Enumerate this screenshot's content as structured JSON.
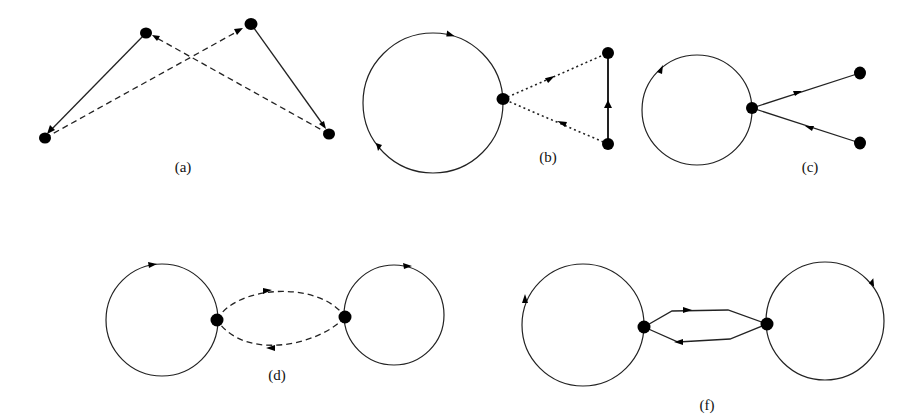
{
  "figure": {
    "background": "#ffffff",
    "ink_color": "#000000",
    "panels": [
      {
        "id": "a",
        "label": "(a)",
        "nodes": [
          {
            "id": "a1",
            "x": 146,
            "y": 33
          },
          {
            "id": "a2",
            "x": 251,
            "y": 24
          },
          {
            "id": "a3",
            "x": 45,
            "y": 138
          },
          {
            "id": "a4",
            "x": 329,
            "y": 134
          }
        ],
        "edges": [
          {
            "from": "a1",
            "to": "a3",
            "style": "solid"
          },
          {
            "from": "a3",
            "to": "a2",
            "style": "dashed"
          },
          {
            "from": "a2",
            "to": "a4",
            "style": "solid"
          },
          {
            "from": "a4",
            "to": "a1",
            "style": "dashed"
          }
        ]
      },
      {
        "id": "b",
        "label": "(b)",
        "loops": [
          {
            "cx": 433,
            "cy": 103,
            "r": 70,
            "direction": "clockwise"
          }
        ],
        "nodes": [
          {
            "id": "b1",
            "x": 503,
            "y": 99
          },
          {
            "id": "b2",
            "x": 608,
            "y": 53
          },
          {
            "id": "b3",
            "x": 608,
            "y": 144
          }
        ],
        "edges": [
          {
            "from": "b1",
            "to": "b2",
            "style": "dotted"
          },
          {
            "from": "b3",
            "to": "b2",
            "style": "solid-thick"
          },
          {
            "from": "b3",
            "to": "b1",
            "style": "dotted"
          }
        ]
      },
      {
        "id": "c",
        "label": "(c)",
        "loops": [
          {
            "cx": 697,
            "cy": 110,
            "r": 55,
            "direction": "clockwise"
          }
        ],
        "nodes": [
          {
            "id": "c1",
            "x": 752,
            "y": 108
          },
          {
            "id": "c2",
            "x": 860,
            "y": 73
          },
          {
            "id": "c3",
            "x": 860,
            "y": 143
          }
        ],
        "edges": [
          {
            "from": "c1",
            "to": "c2",
            "style": "solid"
          },
          {
            "from": "c3",
            "to": "c1",
            "style": "solid"
          }
        ]
      },
      {
        "id": "d",
        "label": "(d)",
        "loops": [
          {
            "cx": 162,
            "cy": 320,
            "r": 56,
            "direction": "clockwise"
          },
          {
            "cx": 394,
            "cy": 315,
            "r": 50,
            "direction": "clockwise"
          }
        ],
        "nodes": [
          {
            "id": "d1",
            "x": 217,
            "y": 320
          },
          {
            "id": "d2",
            "x": 345,
            "y": 317
          }
        ],
        "edges": [
          {
            "from": "d1",
            "to": "d2",
            "style": "dashed-curve-upper"
          },
          {
            "from": "d2",
            "to": "d1",
            "style": "dashed-curve-lower"
          }
        ]
      },
      {
        "id": "f",
        "label": "(f)",
        "loops": [
          {
            "cx": 583,
            "cy": 325,
            "r": 61,
            "direction": "clockwise"
          },
          {
            "cx": 825,
            "cy": 321,
            "r": 59,
            "direction": "clockwise"
          }
        ],
        "nodes": [
          {
            "id": "f1",
            "x": 644,
            "y": 327
          },
          {
            "id": "f2",
            "x": 767,
            "y": 324
          }
        ],
        "edges": [
          {
            "from": "f1",
            "to": "f2",
            "style": "solid-polyline-upper"
          },
          {
            "from": "f2",
            "to": "f1",
            "style": "solid-polyline-lower"
          }
        ]
      }
    ]
  }
}
